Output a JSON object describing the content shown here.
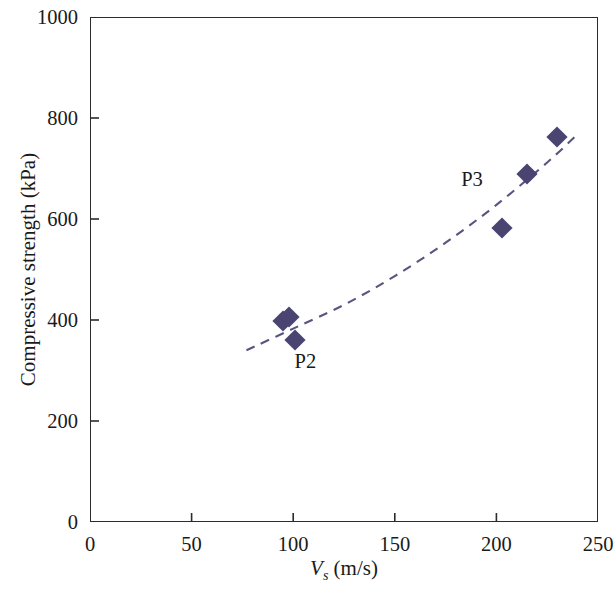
{
  "chart_data": {
    "type": "scatter",
    "title": "",
    "xlabel": "Vs (m/s)",
    "ylabel": "Compressive strength (kPa)",
    "xlim": [
      0,
      250
    ],
    "ylim": [
      0,
      1000
    ],
    "xticks": [
      0,
      50,
      100,
      150,
      200,
      250
    ],
    "yticks": [
      0,
      200,
      400,
      600,
      800,
      1000
    ],
    "grid": false,
    "legend": null,
    "marker_color": "#4a4570",
    "trendline_color": "#5a5580",
    "trendline_style": "dashed",
    "points": [
      {
        "x": 95,
        "y": 398
      },
      {
        "x": 98,
        "y": 405
      },
      {
        "x": 101,
        "y": 361
      },
      {
        "x": 203,
        "y": 583
      },
      {
        "x": 215,
        "y": 690
      },
      {
        "x": 230,
        "y": 763
      }
    ],
    "annotations": [
      {
        "text": "P2",
        "x": 106,
        "y": 318
      },
      {
        "text": "P3",
        "x": 188,
        "y": 680
      }
    ],
    "trendline": [
      {
        "x": 77,
        "y": 340
      },
      {
        "x": 100,
        "y": 383
      },
      {
        "x": 125,
        "y": 430
      },
      {
        "x": 150,
        "y": 487
      },
      {
        "x": 175,
        "y": 553
      },
      {
        "x": 200,
        "y": 628
      },
      {
        "x": 225,
        "y": 712
      },
      {
        "x": 240,
        "y": 768
      }
    ]
  },
  "axes": {
    "x_title_symbol": "V",
    "x_title_subscript": "s",
    "x_title_unit": " (m/s)",
    "y_title": "Compressive strength (kPa)",
    "x_tick_labels": [
      "0",
      "50",
      "100",
      "150",
      "200",
      "250"
    ],
    "y_tick_labels": [
      "0",
      "200",
      "400",
      "600",
      "800",
      "1000"
    ]
  }
}
